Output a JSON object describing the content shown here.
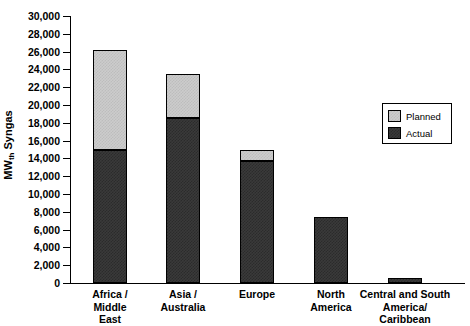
{
  "chart_data": {
    "type": "bar",
    "subtype": "stacked-vertical",
    "title": "",
    "xlabel": "",
    "ylabel": "MWth Syngas",
    "ylabel_parts": {
      "main": "MW",
      "subscript": "th",
      "tail": " Syngas"
    },
    "ylim": [
      0,
      30000
    ],
    "ytick_step": 2000,
    "grid": false,
    "categories": [
      "Africa / Middle East",
      "Asia / Australia",
      "Europe",
      "North America",
      "Central and South America/ Caribbean"
    ],
    "category_lines": [
      [
        "Africa /",
        "Middle",
        "East"
      ],
      [
        "Asia /",
        "Australia"
      ],
      [
        "Europe"
      ],
      [
        "North",
        "America"
      ],
      [
        "Central and South",
        "America/",
        "Caribbean"
      ]
    ],
    "ytick_labels": [
      "30,000",
      "28,000",
      "26,000",
      "24,000",
      "22,000",
      "20,000",
      "18,000",
      "16,000",
      "14,000",
      "12,000",
      "10,000",
      "8,000",
      "6,000",
      "4,000",
      "2,000",
      "0"
    ],
    "ytick_values": [
      30000,
      28000,
      26000,
      24000,
      22000,
      20000,
      18000,
      16000,
      14000,
      12000,
      10000,
      8000,
      6000,
      4000,
      2000,
      0
    ],
    "series": [
      {
        "name": "Actual",
        "color": "#333333",
        "values": [
          15000,
          18500,
          13700,
          7400,
          600
        ]
      },
      {
        "name": "Planned",
        "color": "#cccccc",
        "values": [
          11200,
          5000,
          1300,
          0,
          0
        ]
      }
    ],
    "totals": [
      26200,
      23500,
      15000,
      7400,
      600
    ],
    "legend": {
      "position": "right-inside",
      "entries": [
        {
          "label": "Planned",
          "color": "#cccccc"
        },
        {
          "label": "Actual",
          "color": "#333333"
        }
      ]
    }
  }
}
